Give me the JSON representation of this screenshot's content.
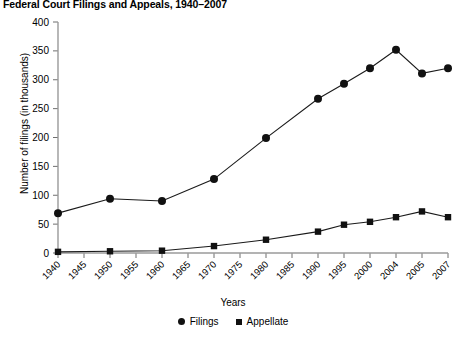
{
  "chart_data": {
    "type": "line",
    "title": "Federal Court Filings and Appeals, 1940–2007",
    "xlabel": "Years",
    "ylabel": "Number of filings (in thousands)",
    "categories": [
      "1940",
      "1945",
      "1950",
      "1955",
      "1960",
      "1965",
      "1970",
      "1975",
      "1980",
      "1985",
      "1990",
      "1995",
      "2000",
      "2004",
      "2005",
      "2007"
    ],
    "ylim": [
      0,
      400
    ],
    "yticks": [
      0,
      50,
      100,
      150,
      200,
      250,
      300,
      350,
      400
    ],
    "grid": false,
    "legend_position": "bottom-center",
    "series": [
      {
        "name": "Filings",
        "marker": "circle",
        "color": "#111111",
        "values": [
          69,
          null,
          94,
          null,
          90,
          null,
          128,
          null,
          199,
          null,
          267,
          293,
          320,
          352,
          311,
          320
        ]
      },
      {
        "name": "Appellate",
        "marker": "square",
        "color": "#111111",
        "values": [
          2,
          null,
          3,
          null,
          4,
          null,
          12,
          null,
          23,
          null,
          37,
          49,
          54,
          62,
          72,
          62
        ]
      }
    ]
  },
  "legend": {
    "items": [
      {
        "label": "Filings",
        "marker": "circle-marker"
      },
      {
        "label": "Appellate",
        "marker": "square-marker"
      }
    ]
  }
}
